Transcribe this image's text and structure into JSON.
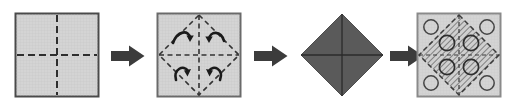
{
  "diagram": {
    "step_count": 4,
    "arrow_count": 3,
    "colors": {
      "panel_fill": "#d4d4d4",
      "panel_border": "#555555",
      "fold_line": "#333333",
      "dark_fill": "#5a5a5a",
      "arrow_fill": "#3c3c3c",
      "hatch_line": "#6e6e6e",
      "circle_stroke": "#444444",
      "background": "#ffffff"
    },
    "steps": [
      {
        "index": 1,
        "name": "flat-square-with-creases",
        "label": "Flat square sheet with horizontal and vertical dashed crease lines",
        "shape": "square",
        "fill": "#d4d4d4",
        "creases": [
          "horizontal-dashed-midline",
          "vertical-dashed-midline"
        ],
        "markers": []
      },
      {
        "index": 2,
        "name": "square-with-diamond-creases-and-fold-arrows",
        "label": "Square with dashed diamond (rotated square) crease and four curved fold arrows",
        "shape": "square",
        "fill": "#d4d4d4",
        "creases": [
          "diamond-dashed-outline",
          "horizontal-dashed-midline",
          "vertical-dashed-midline"
        ],
        "markers": [
          "curved-arrow-top-left",
          "curved-arrow-top-right",
          "curved-arrow-bottom-left",
          "curved-arrow-bottom-right"
        ]
      },
      {
        "index": 3,
        "name": "folded-dark-diamond",
        "label": "Folded result: solid dark diamond divided into four triangles",
        "shape": "diamond",
        "fill": "#5a5a5a",
        "creases": [
          "horizontal-solid-midline",
          "vertical-solid-midline"
        ],
        "markers": []
      },
      {
        "index": 4,
        "name": "hatched-diamond-with-circles",
        "label": "Square with hatched diamond overlay and eight circular holes",
        "shape": "square",
        "fill": "#d4d4d4",
        "creases": [
          "diamond-hatched-region",
          "horizontal-dashed-midline",
          "vertical-dashed-midline"
        ],
        "markers": [
          "circle-corner-top-left",
          "circle-corner-top-right",
          "circle-corner-bottom-left",
          "circle-corner-bottom-right",
          "circle-inner-top-left",
          "circle-inner-top-right",
          "circle-inner-bottom-left",
          "circle-inner-bottom-right"
        ],
        "circle_count": 8
      }
    ],
    "arrows": [
      {
        "index": 1,
        "name": "step-arrow-1",
        "direction": "right",
        "label": "proceeds to step 2"
      },
      {
        "index": 2,
        "name": "step-arrow-2",
        "direction": "right",
        "label": "proceeds to step 3"
      },
      {
        "index": 3,
        "name": "step-arrow-3",
        "direction": "right",
        "label": "proceeds to step 4"
      }
    ]
  }
}
